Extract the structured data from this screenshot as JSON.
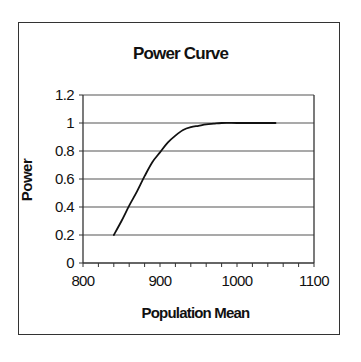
{
  "chart_data": {
    "type": "line",
    "title": "Power Curve",
    "xlabel": "Population Mean",
    "ylabel": "Power",
    "xlim": [
      800,
      1100
    ],
    "ylim": [
      0,
      1.2
    ],
    "x_ticks": [
      800,
      900,
      1000,
      1100
    ],
    "x_minor_step": 20,
    "y_ticks": [
      0,
      0.2,
      0.4,
      0.6,
      0.8,
      1,
      1.2
    ],
    "y_tick_labels": [
      "0",
      "0.2",
      "0.4",
      "0.6",
      "0.8",
      "1",
      "1.2"
    ],
    "x_tick_labels": [
      "800",
      "900",
      "1000",
      "1100"
    ],
    "grid": "horizontal major gridlines",
    "legend": "none",
    "series": [
      {
        "name": "Power",
        "color": "#111111",
        "x": [
          840,
          850,
          860,
          870,
          880,
          890,
          900,
          910,
          920,
          930,
          940,
          950,
          960,
          970,
          980,
          1000,
          1020,
          1050
        ],
        "y": [
          0.2,
          0.3,
          0.41,
          0.51,
          0.62,
          0.72,
          0.79,
          0.86,
          0.91,
          0.95,
          0.97,
          0.98,
          0.99,
          0.995,
          1.0,
          1.0,
          1.0,
          1.0
        ]
      }
    ]
  },
  "colors": {
    "axis": "#333333",
    "gridline": "#555555",
    "line": "#111111",
    "background": "#ffffff"
  }
}
